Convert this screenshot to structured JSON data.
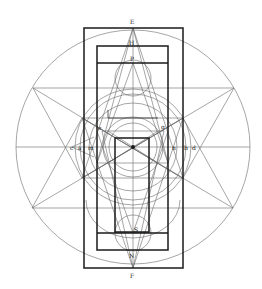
{
  "diagram": {
    "labels": {
      "top": "E",
      "upper_inner": "H",
      "upper_center": "P",
      "left_upper": "e",
      "right_upper": "g",
      "left_axis_outer": "c",
      "left_axis_mid": "a",
      "left_axis_inner": "m",
      "right_axis_inner": "n",
      "right_axis_mid": "b",
      "right_axis_outer": "d",
      "lower_center": "S",
      "lower_inner": "N",
      "bottom": "F"
    },
    "colors": {
      "line": "#6a6a6a",
      "thick_line": "#1a1a1a",
      "background": "#ffffff"
    }
  }
}
